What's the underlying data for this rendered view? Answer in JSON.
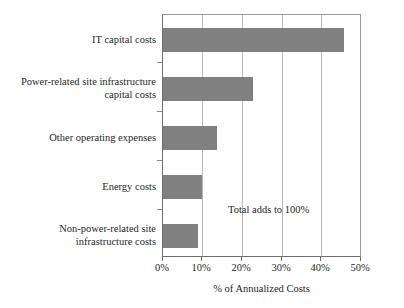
{
  "chart_data": {
    "type": "bar",
    "orientation": "horizontal",
    "title": "",
    "xlabel": "% of  Annualized Costs",
    "ylabel": "",
    "categories": [
      "IT capital costs",
      "Power-related site infrastructure capital costs",
      "Other operating expenses",
      "Energy costs",
      "Non-power-related site infrastructure costs"
    ],
    "category_lines": [
      [
        "IT capital costs"
      ],
      [
        "Power-related site infrastructure",
        "capital costs"
      ],
      [
        "Other operating expenses"
      ],
      [
        "Energy costs"
      ],
      [
        "Non-power-related site",
        "infrastructure costs"
      ]
    ],
    "values": [
      45.8,
      22.8,
      13.7,
      9.8,
      8.8
    ],
    "xlim": [
      0,
      50
    ],
    "xticks": [
      0,
      10,
      20,
      30,
      40,
      50
    ],
    "xtick_labels": [
      "0%",
      "10%",
      "20%",
      "30%",
      "40%",
      "50%"
    ],
    "grid": true,
    "grid_axis": "x",
    "legend": "none",
    "bar_color": "#808080",
    "annotations": [
      {
        "text": "Total adds to 100%",
        "x": 16.5,
        "y_index": 4
      }
    ]
  }
}
